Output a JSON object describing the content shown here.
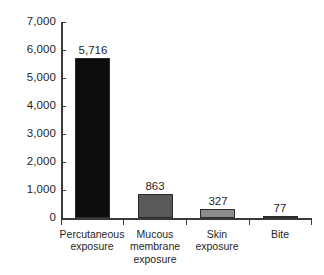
{
  "chart_data": {
    "type": "bar",
    "title": "",
    "subtitle": "",
    "xlabel": "",
    "ylabel": "",
    "categories": [
      "Percutaneous exposure",
      "Mucous membrane exposure",
      "Skin exposure",
      "Bite"
    ],
    "category_lines": [
      [
        "Percutaneous",
        "exposure"
      ],
      [
        "Mucous",
        "membrane",
        "exposure"
      ],
      [
        "Skin",
        "exposure"
      ],
      [
        "Bite"
      ]
    ],
    "values": [
      5716,
      863,
      327,
      77
    ],
    "value_labels": [
      "5,716",
      "863",
      "327",
      "77"
    ],
    "bar_colors": [
      "#0d0d0d",
      "#595959",
      "#8c8c8c",
      "#a6a6a6"
    ],
    "ylim": [
      0,
      7000
    ],
    "y_ticks": [
      0,
      1000,
      2000,
      3000,
      4000,
      5000,
      6000,
      7000
    ],
    "y_tick_labels": [
      "0",
      "1,000",
      "2,000",
      "3,000",
      "4,000",
      "5,000",
      "6,000",
      "7,000"
    ],
    "grid": false,
    "legend": false,
    "legend_position": "none",
    "axis_color": "#3a3a3a",
    "background_color": "#ffffff"
  }
}
